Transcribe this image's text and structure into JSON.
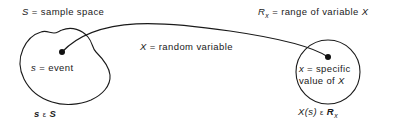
{
  "diagram": {
    "ink_color": "#1a1a1a",
    "background_color": "#ffffff",
    "labels": {
      "sample_space": {
        "symbol": "S",
        "equals": "=",
        "text": "sample space",
        "full": "S = sample space"
      },
      "range": {
        "symbol": "R",
        "subscript": "x",
        "equals": "=",
        "text": "range of variable",
        "variable": "X",
        "full": "Rₓ = range of variable X"
      },
      "random_variable": {
        "symbol": "X",
        "equals": "=",
        "text": "random variable",
        "full": "X = random variable"
      },
      "event": {
        "symbol": "s",
        "equals": "=",
        "text": "event",
        "full": "s = event"
      },
      "specific_value": {
        "symbol": "x",
        "equals": "=",
        "line1": "specific",
        "line2_prefix": "value of",
        "line2_variable": "X",
        "full": "x = specific value of X"
      },
      "membership_left": {
        "element": "s",
        "relation": "ε",
        "set": "S",
        "full": "s ε S"
      },
      "membership_right": {
        "element": "X(s)",
        "relation": "ε",
        "set": "R",
        "set_subscript": "x",
        "full": "X(s) ε Rₓ"
      }
    },
    "shapes": {
      "sample_space_blob": "irregular closed curve, left side",
      "range_circle": "circle, right side",
      "mapping_arc": "curve from event dot to specific value dot",
      "event_dot": {
        "x": 62,
        "y": 52
      },
      "value_dot": {
        "x": 328,
        "y": 57
      }
    }
  }
}
